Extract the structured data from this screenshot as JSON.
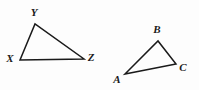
{
  "figure": {
    "background_color": "#fdfdfd",
    "stroke_color": "#1a1a1a",
    "label_color": "#1a1a1a",
    "width": 199,
    "height": 90,
    "shapes": [
      {
        "name": "triangle-xyz",
        "kind": "triangle",
        "vertices": [
          {
            "label": "X",
            "x": 20,
            "y": 60,
            "label_x": 10,
            "label_y": 58
          },
          {
            "label": "Y",
            "x": 35,
            "y": 24,
            "label_x": 34,
            "label_y": 12
          },
          {
            "label": "Z",
            "x": 84,
            "y": 59,
            "label_x": 91,
            "label_y": 57
          }
        ],
        "points": "20,60 35,24 84,59",
        "stroke_width": 1.5
      },
      {
        "name": "triangle-abc",
        "kind": "triangle",
        "vertices": [
          {
            "label": "A",
            "x": 125,
            "y": 74,
            "label_x": 117,
            "label_y": 79
          },
          {
            "label": "B",
            "x": 158,
            "y": 41,
            "label_x": 157,
            "label_y": 29
          },
          {
            "label": "C",
            "x": 176,
            "y": 64,
            "label_x": 183,
            "label_y": 67
          }
        ],
        "points": "125,74 158,41 176,64",
        "stroke_width": 1.5
      }
    ]
  }
}
